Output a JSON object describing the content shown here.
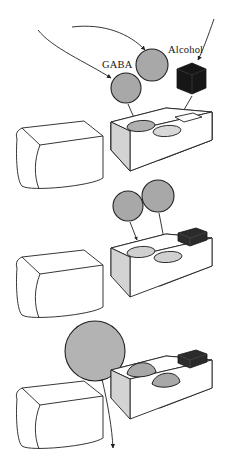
{
  "figure": {
    "title_visible": false,
    "labels": {
      "gaba": "GABA",
      "alcohol": "Alcohol"
    },
    "colors": {
      "outline": "#231f20",
      "molecule_fill": "#a8a8a8",
      "alcohol_fill": "#161616",
      "block_face_shadow": "#d3d3d3",
      "block_face_light": "#ffffff",
      "socket_fill": "#b0b0b0",
      "background": "#ffffff"
    },
    "panels": [
      {
        "name": "panel-binding",
        "index": 1,
        "description": "GABA molecules and alcohol approaching the receptor",
        "elements": [
          "incoming-curve-arrow-left",
          "incoming-curve-arrow-top",
          "incoming-curve-arrow-alcohol",
          "gaba-molecule-1",
          "gaba-molecule-2",
          "alcohol-cube",
          "receptor-block",
          "membrane-block"
        ],
        "gaba_count": 2,
        "alcohol_count": 1,
        "socket_count": 2,
        "alcohol_slot_count": 1
      },
      {
        "name": "panel-docking",
        "index": 2,
        "description": "GABA molecules descending into the receptor sockets, alcohol seated in its slot",
        "elements": [
          "gaba-molecule-1",
          "gaba-molecule-2",
          "alcohol-cube-seated",
          "receptor-block",
          "membrane-block"
        ],
        "gaba_count": 2,
        "alcohol_count": 1,
        "socket_count": 2,
        "alcohol_slot_count": 1
      },
      {
        "name": "panel-channel-open",
        "index": 3,
        "description": "GABA bound as domes, channel open, chloride ion passing through",
        "elements": [
          "chloride-ion",
          "chloride-flow-arrow",
          "gaba-bound-dome-1",
          "gaba-bound-dome-2",
          "alcohol-cube-seated",
          "receptor-block",
          "membrane-block"
        ],
        "gaba_count": 2,
        "alcohol_count": 1,
        "bound_dome_count": 2,
        "ion_count": 1
      }
    ]
  }
}
